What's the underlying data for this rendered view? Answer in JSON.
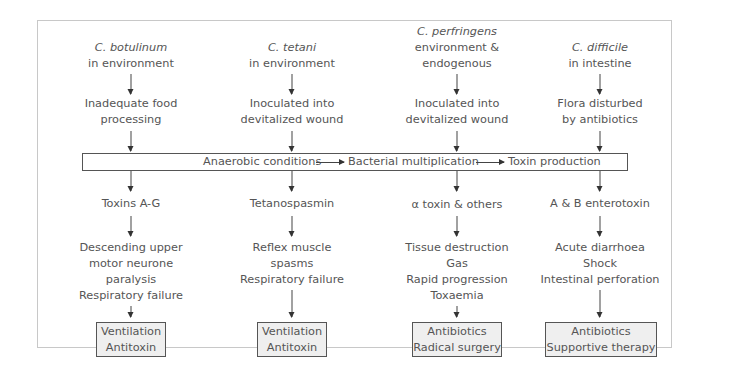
{
  "columns": [
    {
      "organism": "C. botulinum",
      "source": [
        "in environment"
      ],
      "step": [
        "Inadequate food",
        "processing"
      ],
      "toxin": "Toxins A-G",
      "effects": [
        "Descending upper",
        "motor neurone",
        "paralysis",
        "Respiratory failure"
      ],
      "treatment": [
        "Ventilation",
        "Antitoxin"
      ]
    },
    {
      "organism": "C. tetani",
      "source": [
        "in environment"
      ],
      "step": [
        "Inoculated into",
        "devitalized wound"
      ],
      "toxin": "Tetanospasmin",
      "effects": [
        "Reflex muscle",
        "spasms",
        "Respiratory failure"
      ],
      "treatment": [
        "Ventilation",
        "Antitoxin"
      ]
    },
    {
      "organism": "C. perfringens",
      "source": [
        "environment &",
        "endogenous"
      ],
      "step": [
        "Inoculated into",
        "devitalized wound"
      ],
      "toxin": "α toxin & others",
      "effects": [
        "Tissue destruction",
        "Gas",
        "Rapid progression",
        "Toxaemia"
      ],
      "treatment": [
        "Antibiotics",
        "Radical surgery"
      ]
    },
    {
      "organism": "C. difficile",
      "source": [
        "in intestine"
      ],
      "step": [
        "Flora disturbed",
        "by antibiotics"
      ],
      "toxin": "A & B enterotoxin",
      "effects": [
        "Acute diarrhoea",
        "Shock",
        "Intestinal perforation"
      ],
      "treatment": [
        "Antibiotics",
        "Supportive therapy"
      ]
    }
  ],
  "pathway": {
    "stages": [
      "Anaerobic conditions",
      "Bacterial multiplication",
      "Toxin production"
    ]
  },
  "colors": {
    "text": "#555555",
    "line": "#444444",
    "treatment_box_fill": "#efefef",
    "frame_border": "#c8c8c8"
  }
}
